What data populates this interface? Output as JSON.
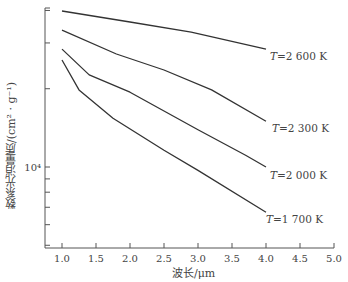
{
  "chart_data": {
    "type": "line",
    "title": "",
    "xlabel": "波长/μm",
    "ylabel": "质量消光系数/(cm²·g⁻¹)",
    "ylabel_display": "数系光消量质/(cm² · g⁻¹)",
    "xlim": [
      0.8,
      5.0
    ],
    "ylim": [
      4000,
      45000
    ],
    "yscale": "log",
    "x_ticks": [
      "1.0",
      "1.5",
      "2.0",
      "2.5",
      "3.0",
      "3.5",
      "4.0",
      "4.5",
      "5.0"
    ],
    "y_tick_labels": [
      {
        "value": 10000,
        "label": "10⁴"
      }
    ],
    "grid": false,
    "legend": "inline labels at right end of lines",
    "series": [
      {
        "name": "T=2 600 K",
        "label_T": "T",
        "label_rest": "=2 600 K",
        "x": [
          1.0,
          2.0,
          2.9,
          4.0
        ],
        "values": [
          39800,
          36100,
          33000,
          28400
        ]
      },
      {
        "name": "T=2 300 K",
        "label_T": "T",
        "label_rest": "=2 300 K",
        "x": [
          1.0,
          1.8,
          2.5,
          3.2,
          4.0
        ],
        "values": [
          33600,
          27200,
          23600,
          19800,
          15000
        ]
      },
      {
        "name": "T=2 000 K",
        "label_T": "T",
        "label_rest": "=2 000 K",
        "x": [
          1.0,
          1.4,
          2.0,
          3.0,
          3.7,
          4.0
        ],
        "values": [
          28400,
          22600,
          19400,
          13900,
          11100,
          10000
        ]
      },
      {
        "name": "T=1 700 K",
        "label_T": "T",
        "label_rest": "=1 700 K",
        "x": [
          1.0,
          1.25,
          1.75,
          2.5,
          3.0,
          4.0
        ],
        "values": [
          25800,
          19800,
          15400,
          11600,
          9700,
          6700
        ]
      }
    ]
  },
  "colors": {
    "line": "#333333",
    "axis": "#555555",
    "text": "#444444"
  }
}
